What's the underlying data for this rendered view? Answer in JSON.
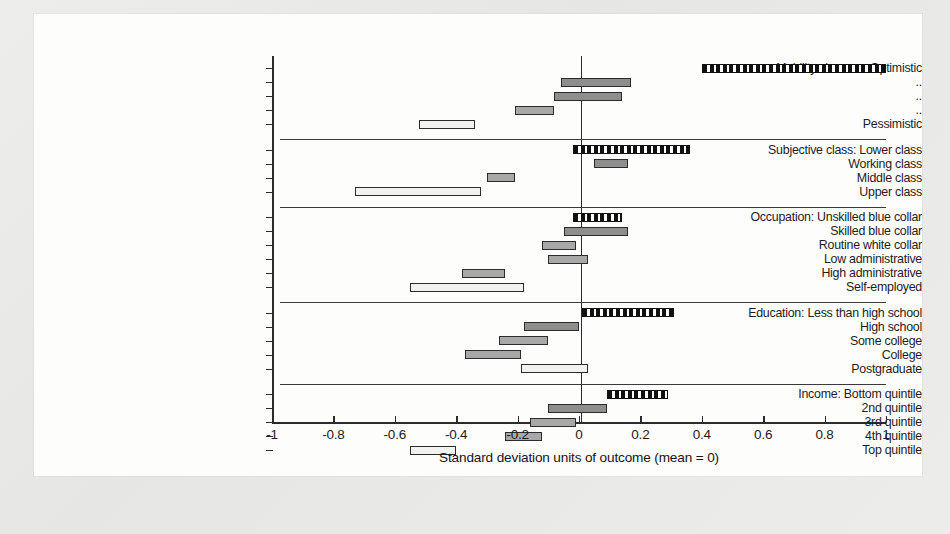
{
  "figure": {
    "xlabel": "Standard deviation units of outcome (mean = 0)"
  },
  "chart_data": {
    "type": "bar",
    "subtype": "horizontal-range-interval",
    "title": "",
    "xlabel": "Standard deviation units of outcome (mean = 0)",
    "ylabel": "",
    "xlim": [
      -1,
      1
    ],
    "xticks": [
      -1,
      -0.8,
      -0.6,
      -0.4,
      -0.2,
      0,
      0.2,
      0.4,
      0.6,
      0.8,
      1
    ],
    "xticklabels": [
      "-1",
      "-0.8",
      "-0.6",
      "-0.4",
      "-0.2",
      "0",
      "0.2",
      "0.4",
      "0.6",
      "0.8",
      "1"
    ],
    "grid": false,
    "zero_reference_line": 0,
    "legend": [],
    "groups": [
      {
        "name": "Mobility chances",
        "rows": [
          {
            "label": "Mobility chances: Optimistic",
            "low": 0.4,
            "high": 1.0,
            "style": "reference-dashed"
          },
          {
            "label": "..",
            "low": -0.06,
            "high": 0.17,
            "style": "dark"
          },
          {
            "label": "..",
            "low": -0.08,
            "high": 0.14,
            "style": "dark"
          },
          {
            "label": "..",
            "low": -0.21,
            "high": -0.08,
            "style": "mid"
          },
          {
            "label": "Pessimistic",
            "low": -0.52,
            "high": -0.34,
            "style": "light"
          }
        ]
      },
      {
        "name": "Subjective class",
        "rows": [
          {
            "label": "Subjective class: Lower class",
            "low": -0.02,
            "high": 0.36,
            "style": "reference-dashed"
          },
          {
            "label": "Working class",
            "low": 0.05,
            "high": 0.16,
            "style": "dark"
          },
          {
            "label": "Middle class",
            "low": -0.3,
            "high": -0.21,
            "style": "mid"
          },
          {
            "label": "Upper class",
            "low": -0.73,
            "high": -0.32,
            "style": "light"
          }
        ]
      },
      {
        "name": "Occupation",
        "rows": [
          {
            "label": "Occupation: Unskilled blue collar",
            "low": -0.02,
            "high": 0.14,
            "style": "reference-dashed"
          },
          {
            "label": "Skilled blue collar",
            "low": -0.05,
            "high": 0.16,
            "style": "dark"
          },
          {
            "label": "Routine white collar",
            "low": -0.12,
            "high": -0.01,
            "style": "mid"
          },
          {
            "label": "Low administrative",
            "low": -0.1,
            "high": 0.03,
            "style": "mid"
          },
          {
            "label": "High administrative",
            "low": -0.38,
            "high": -0.24,
            "style": "mid"
          },
          {
            "label": "Self-employed",
            "low": -0.55,
            "high": -0.18,
            "style": "light"
          }
        ]
      },
      {
        "name": "Education",
        "rows": [
          {
            "label": "Education: Less than high school",
            "low": 0.01,
            "high": 0.31,
            "style": "reference-dashed"
          },
          {
            "label": "High school",
            "low": -0.18,
            "high": 0.0,
            "style": "dark"
          },
          {
            "label": "Some college",
            "low": -0.26,
            "high": -0.1,
            "style": "mid"
          },
          {
            "label": "College",
            "low": -0.37,
            "high": -0.19,
            "style": "mid"
          },
          {
            "label": "Postgraduate",
            "low": -0.19,
            "high": 0.03,
            "style": "light"
          }
        ]
      },
      {
        "name": "Income",
        "rows": [
          {
            "label": "Income: Bottom quintile",
            "low": 0.09,
            "high": 0.29,
            "style": "reference-dashed"
          },
          {
            "label": "2nd quintile",
            "low": -0.1,
            "high": 0.09,
            "style": "dark"
          },
          {
            "label": "3rd quintile",
            "low": -0.16,
            "high": -0.01,
            "style": "mid"
          },
          {
            "label": "4th quintile",
            "low": -0.24,
            "high": -0.12,
            "style": "mid"
          },
          {
            "label": "Top quintile",
            "low": -0.55,
            "high": -0.4,
            "style": "light"
          }
        ]
      }
    ]
  }
}
